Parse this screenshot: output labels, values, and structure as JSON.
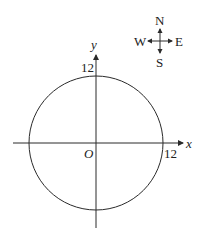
{
  "diagram": {
    "axes": {
      "x_label": "x",
      "y_label": "y",
      "origin_label": "O",
      "x_tick_label": "12",
      "y_tick_label": "12"
    },
    "circle": {
      "center": [
        0,
        0
      ],
      "radius": 12
    },
    "compass": {
      "north": "N",
      "south": "S",
      "east": "E",
      "west": "W"
    },
    "colors": {
      "stroke": "#2a2a2a",
      "text": "#222222"
    }
  }
}
